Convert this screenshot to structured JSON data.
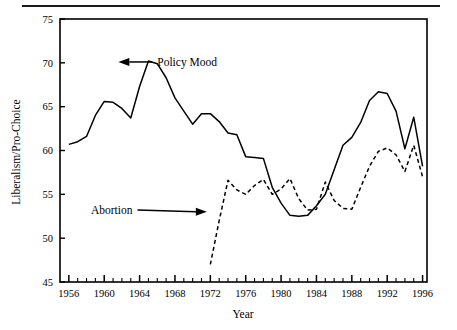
{
  "figure": {
    "has_top_rule": true,
    "background": "#ffffff",
    "ink_color": "#000000"
  },
  "chart_data": {
    "type": "line",
    "title": "",
    "subtitle": "",
    "xlabel": "Year",
    "ylabel": "Liberalism/Pro-Choice",
    "xlim": [
      1955,
      1996.5
    ],
    "ylim": [
      45,
      75
    ],
    "yticks": [
      45,
      50,
      55,
      60,
      65,
      70,
      75
    ],
    "ytick_labels": [
      "45",
      "50",
      "55",
      "60",
      "65",
      "70",
      "75"
    ],
    "xticks": [
      1956,
      1960,
      1964,
      1968,
      1972,
      1976,
      1980,
      1984,
      1988,
      1992,
      1996
    ],
    "xtick_labels": [
      "1956",
      "1960",
      "1964",
      "1968",
      "1972",
      "1976",
      "1980",
      "1984",
      "1988",
      "1992",
      "1996"
    ],
    "x_minor_tick_interval": 1,
    "grid": false,
    "legend": "none",
    "annotations": [
      {
        "name": "policy-mood-annotation",
        "label": "Policy Mood",
        "text_x": 1966.0,
        "text_y": 70.1,
        "arrow_to_x": 1961.6,
        "arrow_to_y": 70.1
      },
      {
        "name": "abortion-annotation",
        "label": "Abortion",
        "text_x": 1963.2,
        "text_y": 53.2,
        "arrow_to_x": 1971.6,
        "arrow_to_y": 53.0
      }
    ],
    "series": [
      {
        "name": "Policy Mood",
        "style": "solid",
        "color": "#000000",
        "x": [
          1956,
          1957,
          1958,
          1959,
          1960,
          1961,
          1962,
          1963,
          1964,
          1965,
          1966,
          1967,
          1968,
          1969,
          1970,
          1971,
          1972,
          1973,
          1974,
          1975,
          1976,
          1977,
          1978,
          1979,
          1980,
          1981,
          1982,
          1983,
          1984,
          1985,
          1986,
          1987,
          1988,
          1989,
          1990,
          1991,
          1992,
          1993,
          1994,
          1995,
          1996
        ],
        "values": [
          60.7,
          61.0,
          61.6,
          64.0,
          65.6,
          65.5,
          64.8,
          63.7,
          67.3,
          70.2,
          69.9,
          68.3,
          66.0,
          64.5,
          63.0,
          64.2,
          64.2,
          63.3,
          62.0,
          61.8,
          59.3,
          59.2,
          59.1,
          55.8,
          54.0,
          52.6,
          52.5,
          52.6,
          53.7,
          55.0,
          57.8,
          60.6,
          61.5,
          63.2,
          65.7,
          66.7,
          66.5,
          64.5,
          60.2,
          63.8,
          58.2
        ]
      },
      {
        "name": "Abortion",
        "style": "dashed",
        "color": "#000000",
        "x": [
          1972,
          1973,
          1974,
          1975,
          1976,
          1977,
          1978,
          1979,
          1980,
          1981,
          1982,
          1983,
          1984,
          1985,
          1986,
          1987,
          1988,
          1989,
          1990,
          1991,
          1992,
          1993,
          1994,
          1995,
          1996
        ],
        "values": [
          47.0,
          52.0,
          56.6,
          55.5,
          55.0,
          56.0,
          56.7,
          55.0,
          55.6,
          56.8,
          54.5,
          53.2,
          53.3,
          56.4,
          54.3,
          53.4,
          53.3,
          55.8,
          58.2,
          59.9,
          60.3,
          59.5,
          57.6,
          60.6,
          57.0
        ]
      }
    ]
  }
}
